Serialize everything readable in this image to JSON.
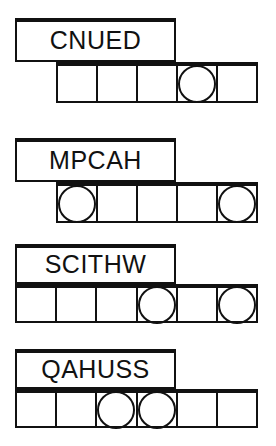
{
  "page": {
    "ink_color": "#111111",
    "paper_color": "#ffffff"
  },
  "puzzles": [
    {
      "id": "puzzle-1",
      "scrambled_word": "CNUED",
      "letter_count": 5,
      "answer_cells": 5,
      "circled_cell_indices": [
        3
      ],
      "box": {
        "label_x": 15,
        "label_y": 18,
        "label_w": 161,
        "label_h": 44,
        "cells_x": 56,
        "cells_y": 62,
        "cells_w": 202,
        "cells_h": 41
      }
    },
    {
      "id": "puzzle-2",
      "scrambled_word": "MPCAH",
      "letter_count": 5,
      "answer_cells": 5,
      "circled_cell_indices": [
        0,
        4
      ],
      "box": {
        "label_x": 15,
        "label_y": 138,
        "label_w": 161,
        "label_h": 44,
        "cells_x": 56,
        "cells_y": 182,
        "cells_w": 202,
        "cells_h": 41
      }
    },
    {
      "id": "puzzle-3",
      "scrambled_word": "SCITHW",
      "letter_count": 6,
      "answer_cells": 6,
      "circled_cell_indices": [
        3,
        5
      ],
      "box": {
        "label_x": 15,
        "label_y": 244,
        "label_w": 161,
        "label_h": 40,
        "cells_x": 15,
        "cells_y": 284,
        "cells_w": 243,
        "cells_h": 39
      }
    },
    {
      "id": "puzzle-4",
      "scrambled_word": "QAHUSS",
      "letter_count": 6,
      "answer_cells": 6,
      "circled_cell_indices": [
        2,
        3
      ],
      "box": {
        "label_x": 15,
        "label_y": 349,
        "label_w": 161,
        "label_h": 40,
        "cells_x": 15,
        "cells_y": 389,
        "cells_w": 243,
        "cells_h": 39
      }
    }
  ]
}
